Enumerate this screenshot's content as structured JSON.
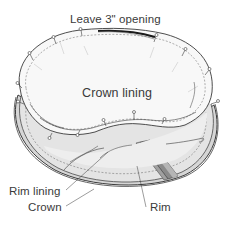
{
  "diagram": {
    "labels": {
      "opening": "Leave 3\" opening",
      "crown_lining": "Crown lining",
      "rim_lining": "Rim lining",
      "crown": "Crown",
      "rim": "Rim"
    },
    "colors": {
      "outline": "#3a3a3a",
      "lining_fill": "#f7f7f7",
      "rim_fill": "#e2e2e2",
      "band_fill": "#8a8a8a",
      "band_light": "#b5b5b5",
      "background": "#ffffff"
    },
    "pin_count": 14
  }
}
